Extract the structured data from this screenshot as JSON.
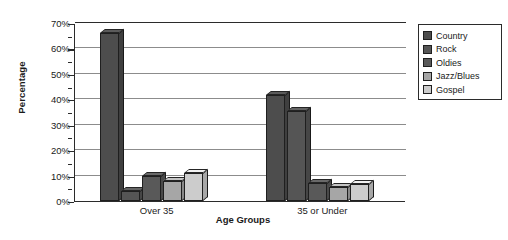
{
  "chart_data": {
    "type": "bar",
    "title": "",
    "xlabel": "Age Groups",
    "ylabel": "Percentage",
    "categories": [
      "Over 35",
      "35 or Under"
    ],
    "series": [
      {
        "name": "Country",
        "color": "#4d4d4d",
        "values": [
          66,
          41.5
        ]
      },
      {
        "name": "Rock",
        "color": "#555555",
        "values": [
          4,
          35.5
        ]
      },
      {
        "name": "Oldies",
        "color": "#595959",
        "values": [
          10,
          7
        ]
      },
      {
        "name": "Jazz/Blues",
        "color": "#a6a6a6",
        "values": [
          8,
          5.5
        ]
      },
      {
        "name": "Gospel",
        "color": "#cccccc",
        "values": [
          11,
          6.5
        ]
      }
    ],
    "ylim": [
      0,
      70
    ],
    "ytick_labels": [
      "0%",
      "10%",
      "20%",
      "30%",
      "40%",
      "50%",
      "60%",
      "70%"
    ],
    "ytick_values": [
      0,
      10,
      20,
      30,
      40,
      50,
      60,
      70
    ],
    "yminor_step": 5,
    "grid": true,
    "legend_position": "right"
  }
}
